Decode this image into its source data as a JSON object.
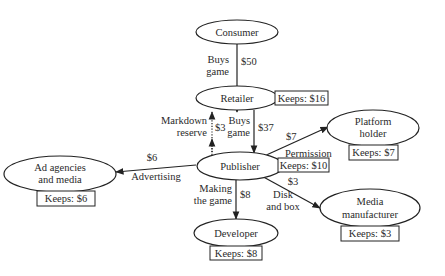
{
  "nodes": {
    "consumer": {
      "label": [
        "Consumer"
      ]
    },
    "retailer": {
      "label": [
        "Retailer"
      ],
      "keeps": "Keeps: $16"
    },
    "publisher": {
      "label": [
        "Publisher"
      ],
      "keeps": "Keeps: $10"
    },
    "platform_holder": {
      "label": [
        "Platform",
        "holder"
      ],
      "keeps": "Keeps: $7"
    },
    "ad_agencies": {
      "label": [
        "Ad agencies",
        "and media"
      ],
      "keeps": "Keeps: $6"
    },
    "media_manufacturer": {
      "label": [
        "Media",
        "manufacturer"
      ],
      "keeps": "Keeps: $3"
    },
    "developer": {
      "label": [
        "Developer"
      ],
      "keeps": "Keeps: $8"
    }
  },
  "edges": {
    "consumer_retailer": {
      "amount": "$50",
      "label": [
        "Buys",
        "game"
      ]
    },
    "publisher_retailer": {
      "amount": "$3",
      "label": [
        "Markdown",
        "reserve"
      ]
    },
    "retailer_publisher": {
      "amount": "$37",
      "label": [
        "Buys",
        "game"
      ]
    },
    "publisher_platform": {
      "amount": "$7",
      "label": [
        "Permission"
      ]
    },
    "publisher_ad": {
      "amount": "$6",
      "label": [
        "Advertising"
      ]
    },
    "publisher_media": {
      "amount": "$3",
      "label": [
        "Disk",
        "and box"
      ]
    },
    "publisher_developer": {
      "amount": "$8",
      "label": [
        "Making",
        "the game"
      ]
    }
  }
}
